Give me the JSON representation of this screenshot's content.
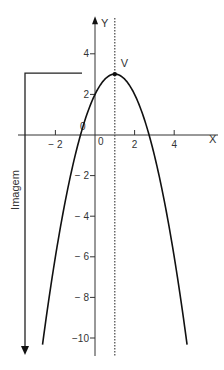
{
  "chart_data": {
    "type": "line",
    "title": "",
    "function": "y = -(x - 1)^2 + 3",
    "coefficients": {
      "a": -1,
      "h": 1,
      "k": 3
    },
    "xlabel": "X",
    "ylabel": "Y",
    "xlim": [
      -3.9,
      6.2
    ],
    "ylim": [
      -10.8,
      5.8
    ],
    "x_ticks": [
      -2,
      2,
      4
    ],
    "x_tick_labels": [
      "− 2",
      "2",
      "4"
    ],
    "y_ticks": [
      4,
      2,
      -2,
      -4,
      -6,
      -8,
      -10
    ],
    "y_tick_labels": [
      "4",
      "2",
      "− 2",
      "− 4",
      "− 6",
      "− 8",
      "−10"
    ],
    "origin_labels": [
      "0",
      "0"
    ],
    "vertex": {
      "label": "V",
      "x": 1,
      "y": 3
    },
    "axis_of_symmetry": {
      "x": 1,
      "style": "dotted"
    },
    "roots": [
      -0.73,
      2.73
    ],
    "y_intercept": 2,
    "curve_x_range": [
      -2.65,
      4.65
    ],
    "image_bracket": {
      "label": "Imagem",
      "from_y": 3,
      "direction": "down"
    },
    "grid": false,
    "legend": null
  },
  "layout": {
    "origin_px": [
      95,
      135
    ],
    "unit_px_x": 19.8,
    "unit_px_y": 20.3,
    "colors": {
      "curve": "#111111",
      "axis": "#333333",
      "text": "#333333"
    }
  }
}
